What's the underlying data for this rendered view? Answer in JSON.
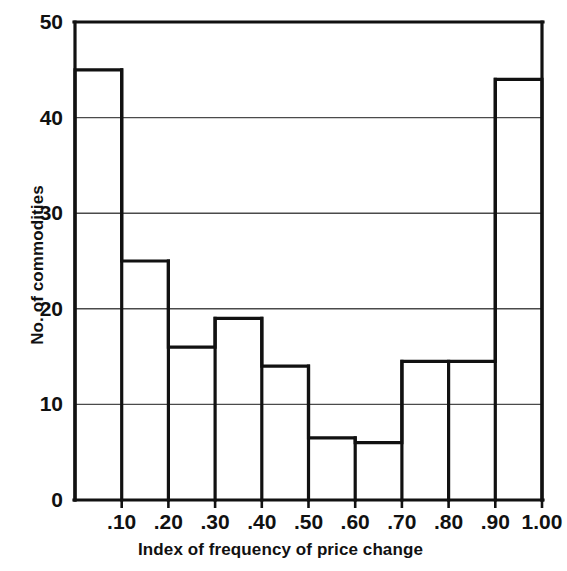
{
  "figure": {
    "background_color": "#ffffff",
    "ink_color": "#111111",
    "grid_color": "#4a4a4a"
  },
  "chart_data": {
    "type": "bar",
    "title": "",
    "subtitle": "",
    "xlabel": "Index of frequency of price change",
    "ylabel": "No. of commodities",
    "categories": [
      "0-.10",
      ".10-.20",
      ".20-.30",
      ".30-.40",
      ".40-.50",
      ".50-.60",
      ".60-.70",
      ".70-.80",
      ".80-.90",
      ".90-1.00"
    ],
    "bin_edges": [
      0.0,
      0.1,
      0.2,
      0.3,
      0.4,
      0.5,
      0.6,
      0.7,
      0.8,
      0.9,
      1.0
    ],
    "values": [
      45,
      25,
      16,
      19,
      14,
      6.5,
      6,
      14.5,
      14.5,
      44
    ],
    "xlim": [
      0.0,
      1.0
    ],
    "ylim": [
      0,
      50
    ],
    "x_tick_labels": [
      ".10",
      ".20",
      ".30",
      ".40",
      ".50",
      ".60",
      ".70",
      ".80",
      ".90",
      "1.00"
    ],
    "x_tick_values": [
      0.1,
      0.2,
      0.3,
      0.4,
      0.5,
      0.6,
      0.7,
      0.8,
      0.9,
      1.0
    ],
    "y_tick_labels": [
      "0",
      "10",
      "20",
      "30",
      "40",
      "50"
    ],
    "y_tick_values": [
      0,
      10,
      20,
      30,
      40,
      50
    ],
    "grid": "horizontal",
    "gridline_values": [
      10,
      20,
      30,
      40
    ],
    "legend": null,
    "legend_position": "none",
    "bar_fill": "none",
    "bar_edge_color": "#111111"
  }
}
